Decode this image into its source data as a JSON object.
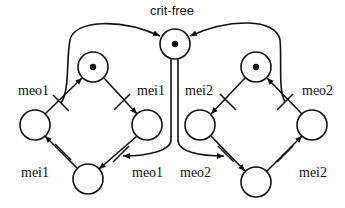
{
  "diagram": {
    "type": "petri-net",
    "stroke_color": "#111111",
    "background": "#ffffff",
    "shared_place": {
      "label": "crit-free",
      "token": true
    },
    "left_subnet": {
      "places": [
        {
          "id": "L-top",
          "token": true
        },
        {
          "id": "L-left",
          "token": false
        },
        {
          "id": "L-right",
          "token": false
        },
        {
          "id": "L-bottom",
          "token": false
        }
      ],
      "transitions": [
        {
          "id": "L-meo1-top",
          "label": "meo1"
        },
        {
          "id": "L-mei1-top",
          "label": "mei1"
        },
        {
          "id": "L-mei1-bottom",
          "label": "mei1"
        },
        {
          "id": "L-meo1-bottom",
          "label": "meo1"
        }
      ]
    },
    "right_subnet": {
      "places": [
        {
          "id": "R-top",
          "token": true
        },
        {
          "id": "R-left",
          "token": false
        },
        {
          "id": "R-right",
          "token": false
        },
        {
          "id": "R-bottom",
          "token": false
        }
      ],
      "transitions": [
        {
          "id": "R-mei2-top",
          "label": "mei2"
        },
        {
          "id": "R-meo2-top",
          "label": "meo2"
        },
        {
          "id": "R-meo2-bottom",
          "label": "meo2"
        },
        {
          "id": "R-mei2-bottom",
          "label": "mei2"
        }
      ]
    }
  },
  "labels": {
    "crit_free": "crit-free",
    "left_top_left": "meo1",
    "left_top_right": "mei1",
    "left_bottom_left": "mei1",
    "left_bottom_right": "meo1",
    "right_top_left": "mei2",
    "right_top_right": "meo2",
    "right_bottom_left": "meo2",
    "right_bottom_right": "mei2"
  }
}
